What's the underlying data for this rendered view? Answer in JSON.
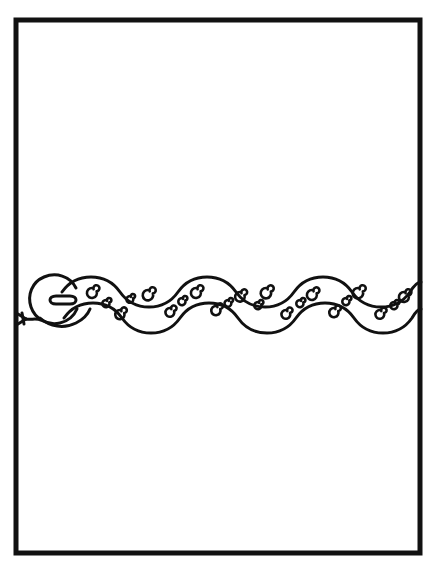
{
  "artwork": {
    "title": "Snake Coloring Page",
    "subject": "snake",
    "style": "black-and-white line art",
    "background_color": "#ffffff",
    "ink_color": "#111111",
    "canvas": {
      "width": 438,
      "height": 569
    }
  },
  "frame": {
    "name": "page-border",
    "shape": "rectangle",
    "stroke_color": "#111111",
    "stroke_width": 5,
    "x": 16,
    "y": 20,
    "width": 404,
    "height": 533
  },
  "snake": {
    "name": "snake-figure",
    "orientation": "horizontal",
    "direction": "head-left-tail-right",
    "body": {
      "stroke_color": "#111111",
      "stroke_width": 3,
      "centerline_y": 305,
      "wave_amplitude": 18,
      "wave_period": 88,
      "wave_count": 4,
      "band_thickness": 26,
      "x_start": 62,
      "x_end": 421
    },
    "head": {
      "name": "snake-head",
      "shape": "rounded-oval",
      "center_x": 57,
      "center_y": 303,
      "radius_x": 28,
      "radius_y": 22
    },
    "eye": {
      "name": "snake-eye",
      "shape": "horizontal-slit-outline",
      "center_x": 64,
      "center_y": 300,
      "width": 24,
      "height": 8
    },
    "tongue": {
      "name": "snake-tongue",
      "shape": "forked",
      "tip_x": 20,
      "base_x": 40,
      "y": 320,
      "fork_count": 2
    },
    "spirals": {
      "name": "body-spirals",
      "count": 22,
      "description": "decorative curl motifs alternating along the upper and lower edges of the body",
      "turns": 1.6
    }
  },
  "labels": {
    "alt_text": "Line drawing of a long wavy snake decorated with spiral curls, inside a thick rectangular border"
  }
}
